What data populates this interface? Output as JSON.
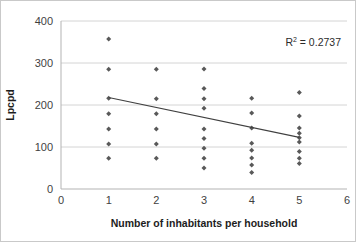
{
  "chart_data": {
    "type": "scatter",
    "title": "",
    "xlabel": "Number of inhabitants per household",
    "ylabel": "Lpcpd",
    "xlim": [
      0,
      6
    ],
    "ylim": [
      0,
      400
    ],
    "xticks": [
      "0",
      "1",
      "2",
      "3",
      "4",
      "5",
      "6"
    ],
    "yticks": [
      "0",
      "100",
      "200",
      "300",
      "400"
    ],
    "grid": "horizontal",
    "legend": "none",
    "annotations": [
      {
        "name": "r-squared",
        "prefix": "R",
        "superscript": "2",
        "suffix": " = 0.2737",
        "text": "R² = 0.2737",
        "value": 0.2737
      }
    ],
    "marker": {
      "shape": "diamond",
      "color": "#595959",
      "size": 5
    },
    "trendline": {
      "type": "linear",
      "color": "#404040",
      "x0": 1,
      "y0": 218,
      "x1": 5,
      "y1": 123
    },
    "points": [
      {
        "x": 1,
        "y": 357
      },
      {
        "x": 1,
        "y": 285
      },
      {
        "x": 1,
        "y": 216
      },
      {
        "x": 1,
        "y": 179
      },
      {
        "x": 1,
        "y": 143
      },
      {
        "x": 1,
        "y": 107
      },
      {
        "x": 1,
        "y": 73
      },
      {
        "x": 2,
        "y": 285
      },
      {
        "x": 2,
        "y": 215
      },
      {
        "x": 2,
        "y": 179
      },
      {
        "x": 2,
        "y": 143
      },
      {
        "x": 2,
        "y": 107
      },
      {
        "x": 2,
        "y": 73
      },
      {
        "x": 3,
        "y": 286
      },
      {
        "x": 3,
        "y": 239
      },
      {
        "x": 3,
        "y": 215
      },
      {
        "x": 3,
        "y": 192
      },
      {
        "x": 3,
        "y": 143
      },
      {
        "x": 3,
        "y": 120
      },
      {
        "x": 3,
        "y": 97
      },
      {
        "x": 3,
        "y": 73
      },
      {
        "x": 3,
        "y": 50
      },
      {
        "x": 4,
        "y": 216
      },
      {
        "x": 4,
        "y": 181
      },
      {
        "x": 4,
        "y": 145
      },
      {
        "x": 4,
        "y": 109
      },
      {
        "x": 4,
        "y": 92
      },
      {
        "x": 4,
        "y": 74
      },
      {
        "x": 4,
        "y": 57
      },
      {
        "x": 4,
        "y": 39
      },
      {
        "x": 5,
        "y": 230
      },
      {
        "x": 5,
        "y": 174
      },
      {
        "x": 5,
        "y": 145
      },
      {
        "x": 5,
        "y": 133
      },
      {
        "x": 5,
        "y": 122
      },
      {
        "x": 5,
        "y": 112
      },
      {
        "x": 5,
        "y": 89
      },
      {
        "x": 5,
        "y": 73
      },
      {
        "x": 5,
        "y": 61
      }
    ],
    "colors": {
      "marker": "#595959",
      "trendline": "#404040",
      "gridline": "#d4d4d4",
      "axis": "#b3b3b3",
      "text": "#3f3f3f",
      "background": "#ffffff",
      "border": "#c9c9c9"
    }
  }
}
